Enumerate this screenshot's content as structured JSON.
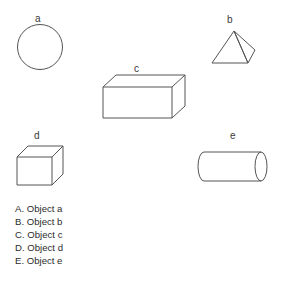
{
  "figures": [
    {
      "id": "a",
      "label": "a",
      "shape": "circle",
      "label_x": 35,
      "label_y": 14,
      "box": {
        "x": 16,
        "y": 23,
        "w": 48,
        "h": 48
      }
    },
    {
      "id": "b",
      "label": "b",
      "shape": "pyramid",
      "label_x": 227,
      "label_y": 15,
      "box": {
        "x": 206,
        "y": 26,
        "w": 54,
        "h": 42
      }
    },
    {
      "id": "c",
      "label": "c",
      "shape": "rectangular-box",
      "label_x": 134,
      "label_y": 64,
      "box": {
        "x": 100,
        "y": 70,
        "w": 80,
        "h": 54
      }
    },
    {
      "id": "d",
      "label": "d",
      "shape": "cube",
      "label_x": 34,
      "label_y": 131,
      "box": {
        "x": 14,
        "y": 140,
        "w": 46,
        "h": 50
      }
    },
    {
      "id": "e",
      "label": "e",
      "shape": "cylinder",
      "label_x": 230,
      "label_y": 131,
      "box": {
        "x": 194,
        "y": 145,
        "w": 74,
        "h": 42
      }
    }
  ],
  "options": [
    {
      "letter": "A.",
      "text": "Object a",
      "full": "A. Object a"
    },
    {
      "letter": "B.",
      "text": "Object b",
      "full": "B. Object b"
    },
    {
      "letter": "C.",
      "text": "Object c",
      "full": "C. Object c"
    },
    {
      "letter": "D.",
      "text": "Object d",
      "full": "D. Object d"
    },
    {
      "letter": "E.",
      "text": "Object e",
      "full": "E. Object e"
    }
  ],
  "colors": {
    "background": "#ffffff",
    "stroke": "#545454",
    "label_text": "#3a3a3a",
    "option_text": "#2b2b2b"
  }
}
